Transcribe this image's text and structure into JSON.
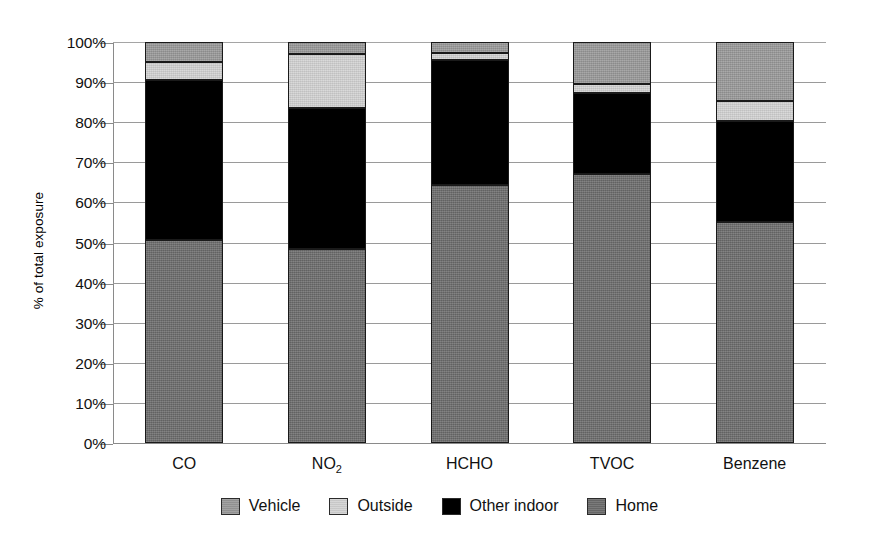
{
  "chart_data": {
    "type": "bar",
    "subtype": "stacked-bar-100-percent",
    "title": "",
    "xlabel": "",
    "ylabel": "% of total exposure",
    "ylim": [
      0,
      100
    ],
    "ytick_labels": [
      "0%",
      "10%",
      "20%",
      "30%",
      "40%",
      "50%",
      "60%",
      "70%",
      "80%",
      "90%",
      "100%"
    ],
    "ytick_values": [
      0,
      10,
      20,
      30,
      40,
      50,
      60,
      70,
      80,
      90,
      100
    ],
    "grid": true,
    "legend_position": "bottom",
    "categories": [
      "CO",
      "NO2",
      "HCHO",
      "TVOC",
      "Benzene"
    ],
    "category_labels_html": [
      "CO",
      "NO<sub>2</sub>",
      "HCHO",
      "TVOC",
      "Benzene"
    ],
    "stack_order_bottom_to_top": [
      "Home",
      "Other indoor",
      "Outside",
      "Vehicle"
    ],
    "series": [
      {
        "name": "Home",
        "color": "#6b6b6b",
        "values": [
          50.5,
          48.5,
          64.3,
          67.1,
          55.2
        ]
      },
      {
        "name": "Other indoor",
        "color": "#000000",
        "values": [
          40.0,
          35.0,
          31.2,
          20.2,
          25.0
        ]
      },
      {
        "name": "Outside",
        "color": "#d2d2d2",
        "values": [
          4.5,
          13.5,
          1.8,
          2.3,
          5.2
        ]
      },
      {
        "name": "Vehicle",
        "color": "#989898",
        "values": [
          5.0,
          3.0,
          2.7,
          10.4,
          14.6
        ]
      }
    ],
    "legend_entries": [
      {
        "label": "Vehicle",
        "color": "#989898"
      },
      {
        "label": "Outside",
        "color": "#d2d2d2"
      },
      {
        "label": "Other indoor",
        "color": "#000000"
      },
      {
        "label": "Home",
        "color": "#6b6b6b"
      }
    ]
  }
}
